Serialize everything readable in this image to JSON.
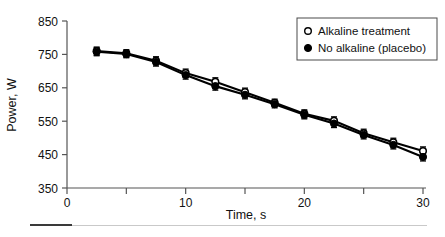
{
  "chart_data": {
    "type": "line",
    "title": "",
    "xlabel": "Time, s",
    "ylabel": "Power, W",
    "xlim": [
      0,
      30
    ],
    "ylim": [
      350,
      850
    ],
    "xticks": [
      0,
      10,
      20,
      30
    ],
    "xtick_labels": [
      "0",
      "10",
      "20",
      "30"
    ],
    "xminor_ticks": [
      5,
      15,
      25
    ],
    "yticks": [
      350,
      450,
      550,
      650,
      750,
      850
    ],
    "ytick_labels": [
      "350",
      "450",
      "550",
      "650",
      "750",
      "850"
    ],
    "grid": false,
    "legend_position": "top-right",
    "x": [
      2.5,
      5,
      7.5,
      10,
      12.5,
      15,
      17.5,
      20,
      22.5,
      25,
      27.5,
      30
    ],
    "series": [
      {
        "name": "Alkaline treatment",
        "marker": "open-circle",
        "values": [
          760,
          753,
          731,
          694,
          668,
          637,
          605,
          572,
          551,
          514,
          487,
          461
        ],
        "errors": [
          12,
          11,
          12,
          12,
          12,
          12,
          11,
          12,
          12,
          12,
          12,
          12
        ]
      },
      {
        "name": "No alkaline (placebo)",
        "marker": "filled-circle",
        "values": [
          758,
          751,
          727,
          688,
          655,
          629,
          601,
          569,
          543,
          509,
          479,
          443
        ],
        "errors": [
          12,
          11,
          12,
          12,
          12,
          12,
          11,
          12,
          12,
          12,
          12,
          12
        ]
      }
    ]
  },
  "legend": {
    "items": [
      {
        "label": "Alkaline treatment",
        "marker": "open-circle"
      },
      {
        "label": "No alkaline (placebo)",
        "marker": "filled-circle"
      }
    ]
  },
  "colors": {
    "series": "#000000",
    "axis": "#555555",
    "text": "#111111",
    "rule_dark": "#3a3a3a",
    "rule_light": "#c9c9c9"
  }
}
